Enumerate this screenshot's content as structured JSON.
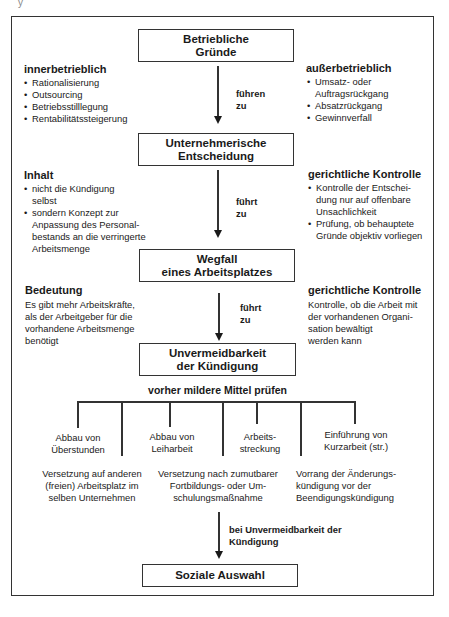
{
  "corner_fragment": "y",
  "boxes": {
    "betriebliche_gruende": [
      "Betriebliche",
      "Gründe"
    ],
    "unternehmerische_entscheidung": [
      "Unternehmerische",
      "Entscheidung"
    ],
    "wegfall": [
      "Wegfall",
      "eines Arbeitsplatzes"
    ],
    "unvermeidbarkeit": [
      "Unvermeidbarkeit",
      "der Kündigung"
    ],
    "soziale_auswahl": "Soziale Auswahl"
  },
  "arrows": {
    "a1": [
      "führen",
      "zu"
    ],
    "a2": [
      "führt",
      "zu"
    ],
    "a3": [
      "führt",
      "zu"
    ],
    "a4": [
      "bei Unvermeidbarkeit der",
      "Kündigung"
    ]
  },
  "section1": {
    "left": {
      "heading": "innerbetrieblich",
      "items": [
        "Rationalisierung",
        "Outsourcing",
        "Betriebsstilllegung",
        "Rentabilitätssteigerung"
      ]
    },
    "right": {
      "heading": "außerbetrieblich",
      "items": [
        [
          "Umsatz- oder",
          "Auftragsrückgang"
        ],
        "Absatzrückgang",
        "Gewinnverfall"
      ]
    }
  },
  "section2": {
    "left": {
      "heading": "Inhalt",
      "items": [
        [
          "nicht die Kündigung",
          "selbst"
        ],
        [
          "sondern Konzept zur",
          "Anpassung des Personal-",
          "bestands an die verringerte",
          "Arbeitsmenge"
        ]
      ]
    },
    "right": {
      "heading": "gerichtliche Kontrolle",
      "items": [
        [
          "Kontrolle der Entschei-",
          "dung nur auf offenbare",
          "Unsachlichkeit"
        ],
        [
          "Prüfung, ob behauptete",
          "Gründe objektiv vorliegen"
        ]
      ]
    }
  },
  "section3": {
    "left": {
      "heading": "Bedeutung",
      "lines": [
        "Es gibt mehr Arbeitskräfte,",
        "als der Arbeitgeber für die",
        "vorhandene Arbeitsmenge",
        "benötigt"
      ]
    },
    "right": {
      "heading": "gerichtliche Kontrolle",
      "lines": [
        "Kontrolle, ob die Arbeit mit",
        "der vorhandenen Organi-",
        "sation bewältigt",
        "werden kann"
      ]
    }
  },
  "milder": {
    "heading": "vorher mildere Mittel prüfen",
    "upper": [
      [
        "Abbau von",
        "Überstunden"
      ],
      [
        "Abbau von",
        "Leiharbeit"
      ],
      [
        "Arbeits-",
        "streckung"
      ],
      [
        "Einführung von",
        "Kurzarbeit (str.)"
      ]
    ],
    "lower": [
      [
        "Versetzung auf anderen",
        "(freien) Arbeitsplatz im",
        "selben Unternehmen"
      ],
      [
        "Versetzung nach zumutbarer",
        "Fortbildungs- oder Um-",
        "schulungsmaßnahme"
      ],
      [
        "Vorrang der Änderungs-",
        "kündigung vor der",
        "Beendigungskündigung"
      ]
    ]
  }
}
